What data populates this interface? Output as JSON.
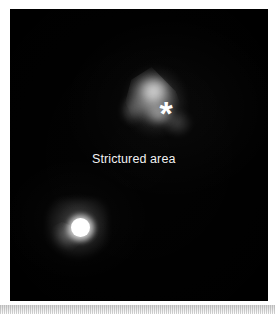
{
  "figure": {
    "kind": "nuclear-medicine-scan",
    "background_color": "#000000",
    "page_color": "#ffffff",
    "annotation_text_color": "#f2f2f2",
    "marker_color": "#ffffff"
  },
  "annotations": {
    "label": "Strictured area",
    "asterisk_marker": "*"
  },
  "features": [
    {
      "name": "diffuse-uptake-blob",
      "description": "triangular diffuse uptake region marked with asterisk",
      "intensity": "moderate"
    },
    {
      "name": "focal-hot-spot",
      "description": "saturated round focus with faint lower-left smear",
      "intensity": "high"
    }
  ],
  "chart_data": {
    "type": "heatmap",
    "title": "",
    "xlabel": "",
    "ylabel": "",
    "grid": false,
    "legend": null,
    "colormap": "grayscale",
    "value_range": [
      0,
      255
    ],
    "annotations": [
      {
        "text": "Strictured area",
        "x": 0.36,
        "y": 0.52,
        "color": "#f2f2f2"
      },
      {
        "text": "*",
        "x": 0.6,
        "y": 0.32,
        "color": "#ffffff"
      }
    ],
    "regions_of_interest": [
      {
        "label": "*",
        "name": "strictured-area-uptake",
        "center": [
          0.6,
          0.33
        ],
        "extent": [
          0.31,
          0.3
        ],
        "peak_value": 150,
        "shape": "triangular-diffuse"
      },
      {
        "label": "",
        "name": "focal-hot-spot",
        "center": [
          0.26,
          0.75
        ],
        "extent": [
          0.08,
          0.07
        ],
        "peak_value": 255,
        "shape": "round-saturated"
      }
    ]
  }
}
